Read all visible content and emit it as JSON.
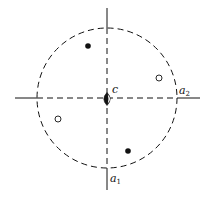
{
  "figure": {
    "type": "stereographic-projection",
    "width": 209,
    "height": 197,
    "colors": {
      "ink": "#111111",
      "background": "#ffffff"
    },
    "primitive_circle": {
      "cx": 107,
      "cy": 98,
      "r": 70,
      "style": "dashed"
    },
    "axes": [
      {
        "id": "a1",
        "orientation": "vertical",
        "x": 107,
        "y_start": 8,
        "y_end": 190,
        "label": "a",
        "subscript": "1",
        "label_x": 110,
        "label_y": 182
      },
      {
        "id": "a2",
        "orientation": "horizontal",
        "y": 98,
        "x_start": 15,
        "x_end": 200,
        "label": "a",
        "subscript": "2",
        "label_x": 179,
        "label_y": 94
      }
    ],
    "center_symbol": {
      "type": "twofold-axis-lens",
      "x": 107,
      "y": 99,
      "label": "c",
      "label_x": 112,
      "label_y": 93
    },
    "poles": [
      {
        "type": "filled",
        "x": 88,
        "y": 46,
        "meaning": "upper-hemisphere"
      },
      {
        "type": "open",
        "x": 159,
        "y": 78,
        "meaning": "lower-hemisphere"
      },
      {
        "type": "open",
        "x": 58,
        "y": 119,
        "meaning": "lower-hemisphere"
      },
      {
        "type": "filled",
        "x": 128,
        "y": 151,
        "meaning": "upper-hemisphere"
      }
    ]
  }
}
